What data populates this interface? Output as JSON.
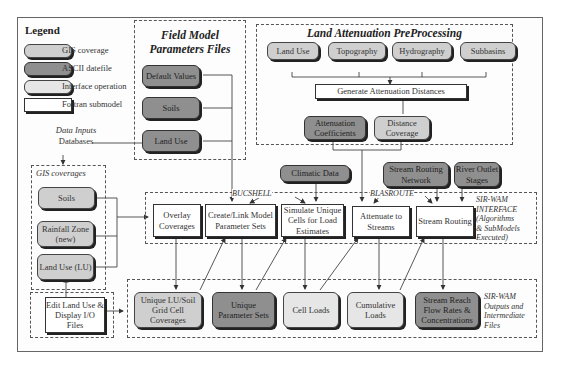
{
  "legend": {
    "title": "Legend",
    "items": [
      {
        "label": "GIS coverage",
        "style": "gis",
        "color": "#cfcfcf"
      },
      {
        "label": "ASCII datefile",
        "style": "ascii",
        "color": "#8f8f8f"
      },
      {
        "label": "Interface operation",
        "style": "iface",
        "color": "#e6e6e6"
      },
      {
        "label": "Fortran submodel",
        "style": "fortran",
        "color": "#ffffff"
      }
    ]
  },
  "field_model": {
    "title_line1": "Field Model",
    "title_line2": "Parameters Files",
    "nodes": [
      "Default Values",
      "Soils",
      "Land Use"
    ]
  },
  "land_attenuation": {
    "title": "Land Attenuation PreProcessing",
    "inputs": [
      "Land Use",
      "Topography",
      "Hydrography",
      "Subbasins"
    ],
    "process": "Generate Attenuation Distances",
    "outputs": [
      "Attenuation Coefficients",
      "Distance Coverage"
    ]
  },
  "data_inputs": {
    "line1": "Data Inputs",
    "line2": "Databases"
  },
  "gis_coverages": {
    "title": "GIS coverages",
    "nodes": [
      "Soils",
      "Rainfall Zone (new)",
      "Land Use (LU)"
    ]
  },
  "external_inputs": {
    "climatic": "Climatic Data",
    "stream_network": "Stream Routing Network",
    "river_outlet": "River Outlet Stages"
  },
  "interface": {
    "bucshell_label": "BUCSHELL",
    "blasroute_label": "BLASROUTE",
    "caption": [
      "SIR-WAM",
      "INTERFACE",
      "(Algorithms",
      "& SubModels",
      "Executed)"
    ],
    "steps": [
      "Overlay Coverages",
      "Create/Link Model Parameter Sets",
      "Simulate Unique Cells for Load Estimates",
      "Attenuate to Streams",
      "Stream Routing"
    ]
  },
  "edit_tool": {
    "label": "Edit Land Use & Display I/O Files"
  },
  "outputs": {
    "caption": [
      "SIR-WAM",
      "Outputs and",
      "Intermediate",
      "Files"
    ],
    "nodes": [
      "Unique LU/Soil Grid Cell Coverages",
      "Unique Parameter Sets",
      "Cell Loads",
      "Cumulative Loads",
      "Stream Reach Flow Rates & Concentrations"
    ]
  }
}
